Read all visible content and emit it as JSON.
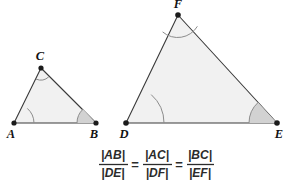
{
  "diagram": {
    "colors": {
      "triangle_fill": "#f1f1f1",
      "triangle_stroke": "#3a3a3a",
      "angle_arc": "#8c8c8c",
      "angle_wedge_fill": "#d2d2d2",
      "vertex_dot": "#1b1b1b",
      "text": "#2b2b2b",
      "label": "#111111",
      "background": "#ffffff"
    },
    "small_triangle": {
      "name": "triangle-abc",
      "vertices": [
        {
          "label": "A",
          "x": 14,
          "y": 123,
          "label_x": 11,
          "label_y": 138
        },
        {
          "label": "B",
          "x": 96,
          "y": 123,
          "label_x": 92,
          "label_y": 138
        },
        {
          "label": "C",
          "x": 41,
          "y": 68,
          "label_x": 37,
          "label_y": 59
        }
      ]
    },
    "large_triangle": {
      "name": "triangle-def",
      "vertices": [
        {
          "label": "D",
          "x": 126,
          "y": 123,
          "label_x": 122,
          "label_y": 138
        },
        {
          "label": "E",
          "x": 277,
          "y": 123,
          "label_x": 273,
          "label_y": 138
        },
        {
          "label": "F",
          "x": 178,
          "y": 15,
          "label_x": 174,
          "label_y": 8
        }
      ]
    },
    "formula": {
      "full": "|AB|/|DE| = |AC|/|DF| = |BC|/|EF|",
      "fractions": [
        {
          "numerator": "|AB|",
          "denominator": "|DE|"
        },
        {
          "numerator": "|AC|",
          "denominator": "|DF|"
        },
        {
          "numerator": "|BC|",
          "denominator": "|EF|"
        }
      ],
      "equals": "="
    }
  }
}
